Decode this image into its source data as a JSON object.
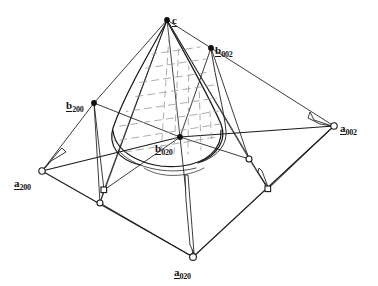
{
  "figure": {
    "type": "geometric-line-diagram",
    "background_color": "#ffffff",
    "line_color": "#1a1a1a",
    "hatch_color": "#9a9a9a"
  },
  "labels": [
    {
      "id": "c",
      "base": "c",
      "sub": "",
      "x": 172,
      "y": 11,
      "anchor": "left"
    },
    {
      "id": "b002",
      "base": "b",
      "sub": "002",
      "x": 215,
      "y": 43,
      "anchor": "left"
    },
    {
      "id": "b200",
      "base": "b",
      "sub": "200",
      "x": 68,
      "y": 96,
      "anchor": "left"
    },
    {
      "id": "b020",
      "base": "b",
      "sub": "020",
      "x": 155,
      "y": 138,
      "anchor": "left"
    },
    {
      "id": "a002",
      "base": "a",
      "sub": "002",
      "x": 340,
      "y": 119,
      "anchor": "left"
    },
    {
      "id": "a200",
      "base": "a",
      "sub": "200",
      "x": 14,
      "y": 172,
      "anchor": "left"
    },
    {
      "id": "a020",
      "base": "a",
      "sub": "020",
      "x": 174,
      "y": 262,
      "anchor": "left"
    }
  ],
  "vertices": {
    "filled": [
      {
        "name": "apex-c",
        "x": 167,
        "y": 20
      },
      {
        "name": "b-002",
        "x": 211,
        "y": 48
      },
      {
        "name": "b-200",
        "x": 94,
        "y": 103
      },
      {
        "name": "b-020",
        "x": 180,
        "y": 137
      }
    ],
    "hollow": [
      {
        "name": "a-200",
        "x": 42,
        "y": 171
      },
      {
        "name": "a-002",
        "x": 334,
        "y": 126
      },
      {
        "name": "a-020",
        "x": 193,
        "y": 257
      },
      {
        "name": "base-left-mid",
        "x": 100,
        "y": 203
      },
      {
        "name": "base-right-mid",
        "x": 249,
        "y": 159
      }
    ],
    "square": [
      {
        "name": "ctrl-left",
        "x": 104,
        "y": 190
      },
      {
        "name": "ctrl-right",
        "x": 268,
        "y": 189
      }
    ]
  },
  "counts": {
    "filled_vertices": 4,
    "hollow_vertices": 5,
    "square_markers": 2,
    "labels": 7
  }
}
